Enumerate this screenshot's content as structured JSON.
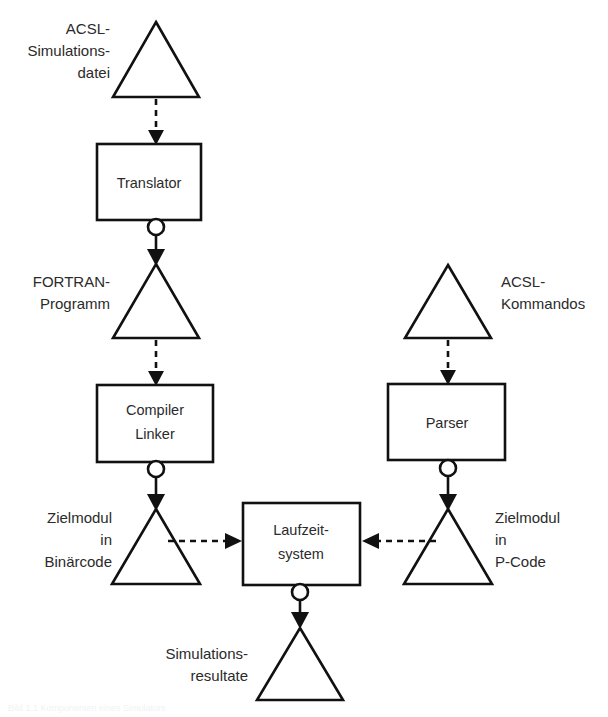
{
  "diagram": {
    "background_color": "#ffffff",
    "stroke_color": "#111111",
    "text_color": "#2b2b2b",
    "processes": [
      {
        "id": "translator",
        "label_line1": "Translator",
        "label_line2": "",
        "x": 97,
        "y": 144,
        "w": 104,
        "h": 76
      },
      {
        "id": "compiler-linker",
        "label_line1": "Compiler",
        "label_line2": "Linker",
        "x": 97,
        "y": 385,
        "w": 116,
        "h": 77
      },
      {
        "id": "parser",
        "label_line1": "Parser",
        "label_line2": "",
        "x": 388,
        "y": 384,
        "w": 117,
        "h": 76
      },
      {
        "id": "runtime-system",
        "label_line1": "Laufzeit-",
        "label_line2": "system",
        "x": 243,
        "y": 503,
        "w": 117,
        "h": 82
      }
    ],
    "data_stores": [
      {
        "id": "acsl-simulation-file",
        "cx": 156,
        "base_y": 97,
        "half_w": 43,
        "h": 75
      },
      {
        "id": "fortran-program",
        "cx": 156,
        "base_y": 338,
        "half_w": 43,
        "h": 74
      },
      {
        "id": "acsl-commands",
        "cx": 448,
        "base_y": 338,
        "half_w": 43,
        "h": 73
      },
      {
        "id": "target-module-binary",
        "cx": 156,
        "base_y": 584,
        "half_w": 44,
        "h": 75
      },
      {
        "id": "target-module-pcode",
        "cx": 448,
        "base_y": 584,
        "half_w": 44,
        "h": 75
      },
      {
        "id": "simulation-results",
        "cx": 300,
        "base_y": 700,
        "half_w": 43,
        "h": 72
      }
    ],
    "labels": [
      {
        "id": "acsl-simulation-file-label",
        "lines": [
          "ACSL-",
          "Simulations-",
          "datei"
        ],
        "x": 110,
        "y": 34,
        "align": "right-aligned"
      },
      {
        "id": "fortran-program-label",
        "lines": [
          "FORTRAN-",
          "Programm"
        ],
        "x": 110,
        "y": 287,
        "align": "right-aligned"
      },
      {
        "id": "acsl-commands-label",
        "lines": [
          "ACSL-",
          "Kommandos"
        ],
        "x": 501,
        "y": 287,
        "align": "left-aligned"
      },
      {
        "id": "target-module-binary-label",
        "lines": [
          "Zielmodul",
          "in",
          "Binärcode"
        ],
        "x": 112,
        "y": 523,
        "align": "right-aligned"
      },
      {
        "id": "target-module-pcode-label",
        "lines": [
          "Zielmodul",
          "in",
          "P-Code"
        ],
        "x": 495,
        "y": 523,
        "align": "left-aligned"
      },
      {
        "id": "simulation-results-label",
        "lines": [
          "Simulations-",
          "resultate"
        ],
        "x": 243,
        "y": 659,
        "align": "right-aligned"
      }
    ],
    "flows": [
      {
        "id": "flow-file-to-translator",
        "style": "dashed",
        "orientation": "vertical-down",
        "x1": 156,
        "y1": 99,
        "x2": 156,
        "y2": 142
      },
      {
        "id": "flow-translator-to-fortran",
        "style": "solid-with-circle",
        "orientation": "vertical-down",
        "x1": 156,
        "y1": 220,
        "x2": 156,
        "y2": 266
      },
      {
        "id": "flow-fortran-to-compiler",
        "style": "dashed",
        "orientation": "vertical-down",
        "x1": 156,
        "y1": 340,
        "x2": 156,
        "y2": 383
      },
      {
        "id": "flow-compiler-to-binary",
        "style": "solid-with-circle",
        "orientation": "vertical-down",
        "x1": 156,
        "y1": 462,
        "x2": 156,
        "y2": 511
      },
      {
        "id": "flow-commands-to-parser",
        "style": "dashed",
        "orientation": "vertical-down",
        "x1": 448,
        "y1": 340,
        "x2": 448,
        "y2": 382
      },
      {
        "id": "flow-parser-to-pcode",
        "style": "solid-with-circle",
        "orientation": "vertical-down",
        "x1": 448,
        "y1": 460,
        "x2": 448,
        "y2": 511
      },
      {
        "id": "flow-binary-to-runtime",
        "style": "dashed",
        "orientation": "horizontal-right",
        "x1": 182,
        "y1": 541,
        "x2": 241,
        "y2": 541
      },
      {
        "id": "flow-pcode-to-runtime",
        "style": "dashed",
        "orientation": "horizontal-left",
        "x1": 422,
        "y1": 541,
        "x2": 362,
        "y2": 541
      },
      {
        "id": "flow-runtime-to-results",
        "style": "solid-with-circle",
        "orientation": "vertical-down",
        "x1": 300,
        "y1": 585,
        "x2": 300,
        "y2": 627
      }
    ]
  },
  "caption": {
    "cut_off_text": "Bild 1.1 Komponenten eines Simulators"
  }
}
